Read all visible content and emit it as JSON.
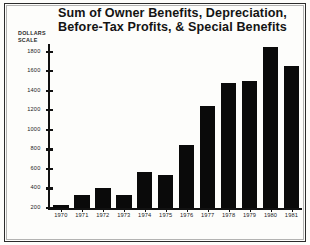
{
  "chart_data": {
    "type": "bar",
    "title": "Sum of Owner Benefits, Depreciation, Before-Tax Profits, & Special Benefits",
    "title_line1": "Sum of Owner Benefits, Depreciation,",
    "title_line2": "Before-Tax Profits, & Special Benefits",
    "xlabel": "",
    "ylabel": "DOLLARS SCALE",
    "ylabel_line1": "DOLLARS",
    "ylabel_line2": "SCALE",
    "categories": [
      "1970",
      "1971",
      "1972",
      "1973",
      "1974",
      "1975",
      "1976",
      "1977",
      "1978",
      "1979",
      "1980",
      "1981"
    ],
    "values": [
      230,
      330,
      400,
      330,
      570,
      540,
      850,
      1250,
      1480,
      1500,
      1850,
      1650
    ],
    "ylim": [
      200,
      1880
    ],
    "yticks": [
      200,
      400,
      600,
      800,
      1000,
      1200,
      1400,
      1600,
      1800
    ],
    "ytick_labels": [
      "200",
      "400",
      "600",
      "800",
      "1000",
      "1200",
      "1400",
      "1600",
      "1800"
    ],
    "grid": false,
    "legend": null,
    "bar_color": "#0a0a0a",
    "background_color": "#fdfdfb",
    "axis_color": "#111111"
  }
}
